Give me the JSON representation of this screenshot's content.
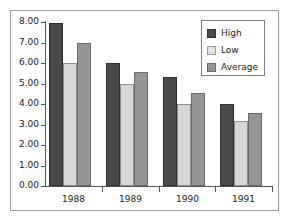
{
  "chart_data": {
    "type": "bar",
    "title": "",
    "xlabel": "",
    "ylabel": "",
    "categories": [
      "1988",
      "1989",
      "1990",
      "1991"
    ],
    "series": [
      {
        "name": "High",
        "color": "#4a4a4a",
        "values": [
          7.95,
          6.0,
          5.3,
          4.0
        ]
      },
      {
        "name": "Low",
        "color": "#d7d7d7",
        "values": [
          6.0,
          5.0,
          4.0,
          3.15
        ]
      },
      {
        "name": "Average",
        "color": "#969696",
        "values": [
          7.0,
          5.55,
          4.55,
          3.55
        ]
      }
    ],
    "ylim": [
      0.0,
      8.0
    ],
    "ytick_step": 1.0,
    "ytick_labels": [
      "8.00",
      "7.00",
      "6.00",
      "5.00",
      "4.00",
      "3.00",
      "2.00",
      "1.00",
      "0.00"
    ],
    "ytick_values": [
      8.0,
      7.0,
      6.0,
      5.0,
      4.0,
      3.0,
      2.0,
      1.0,
      0.0
    ],
    "grid": false,
    "legend_position": "top-right",
    "legend_entries": [
      "High",
      "Low",
      "Average"
    ]
  },
  "figure": {
    "border_color": "#9a9a9a",
    "background": "#ffffff",
    "axis_color": "#555555"
  }
}
